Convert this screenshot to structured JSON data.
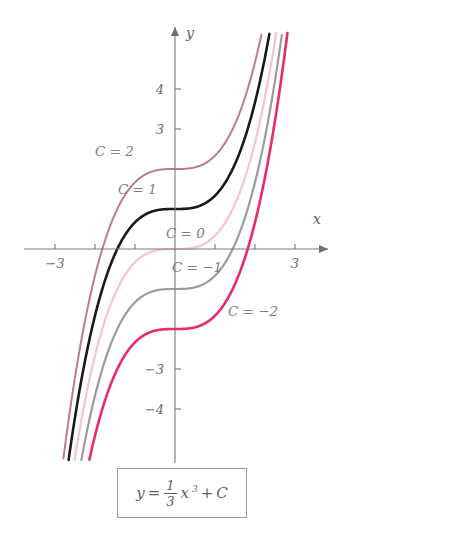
{
  "chart_data": {
    "type": "line",
    "title": "",
    "formula": "y = (1/3)x^3 + C",
    "formula_parts": {
      "lhs": "y",
      "equals": "=",
      "numerator": "1",
      "denominator": "3",
      "variable": "x",
      "exponent": "3",
      "plus": "+",
      "constant": "C"
    },
    "xlabel": "x",
    "ylabel": "y",
    "xlim": [
      -3.6,
      3.6
    ],
    "ylim": [
      -4.9,
      5.1
    ],
    "grid": false,
    "legend_position": "inline-curve-labels",
    "x_ticks": [
      -3,
      -2,
      -1,
      1,
      2,
      3
    ],
    "x_tick_labels": [
      "-3",
      "",
      "",
      "",
      "",
      "3"
    ],
    "y_ticks": [
      4,
      3,
      -3,
      -4
    ],
    "y_tick_labels": [
      "4",
      "3",
      "-3",
      "-4"
    ],
    "series": [
      {
        "name": "C = 2",
        "C": 2,
        "color": "#c1798f",
        "width": 2.0,
        "label": "C = 2",
        "label_x": 95,
        "label_y": 156
      },
      {
        "name": "C = 1",
        "C": 1,
        "color": "#1a1a1a",
        "width": 2.6,
        "label": "C = 1",
        "label_x": 118,
        "label_y": 194
      },
      {
        "name": "C = 0",
        "C": 0,
        "color": "#f5c3d8",
        "width": 2.2,
        "label": "C = 0",
        "label_x": 166,
        "label_y": 238
      },
      {
        "name": "C = -1",
        "C": -1,
        "color": "#9b9b9b",
        "width": 2.2,
        "label": "C = −1",
        "label_x": 172,
        "label_y": 272
      },
      {
        "name": "C = -2",
        "C": -2,
        "color": "#ea2b6b",
        "width": 2.6,
        "label": "C = −2",
        "label_x": 228,
        "label_y": 316
      }
    ],
    "annotations": [
      "C = 2",
      "C = 1",
      "C = 0",
      "C = −1",
      "C = −2"
    ],
    "axes_origin_px": [
      175,
      249
    ],
    "px_per_unit": 40
  }
}
